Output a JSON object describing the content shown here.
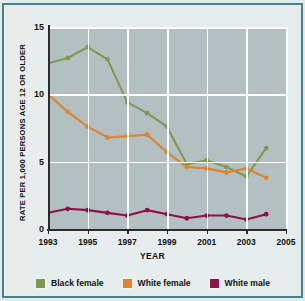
{
  "figure": {
    "background_color": "#e6edec",
    "frame_color": "#4b7f8a",
    "plot_background_color": "#b3bfc0",
    "gridline_color": "#ffffff",
    "title_partial": ""
  },
  "axes": {
    "ylabel": "RATE PER 1,000 PERSONS AGE 12 OR OLDER",
    "xlabel": "YEAR",
    "yticks": [
      "0",
      "5",
      "10",
      "15"
    ],
    "xticks": [
      "1993",
      "1995",
      "1997",
      "1999",
      "2001",
      "2003",
      "2005"
    ]
  },
  "legend": {
    "items": [
      {
        "label": "Black female",
        "color": "#7d9a55"
      },
      {
        "label": "White female",
        "color": "#e08331"
      },
      {
        "label": "White male",
        "color": "#8c1345"
      }
    ]
  },
  "chart_data": {
    "type": "line",
    "title": "",
    "xlabel": "YEAR",
    "ylabel": "RATE PER 1,000 PERSONS AGE 12 OR OLDER",
    "xlim": [
      1993,
      2005
    ],
    "ylim": [
      0,
      15
    ],
    "yticks": [
      0,
      5,
      10,
      15
    ],
    "xticks": [
      1993,
      1995,
      1997,
      1999,
      2001,
      2003,
      2005
    ],
    "grid": true,
    "legend_position": "bottom",
    "x": [
      1993,
      1994,
      1995,
      1996,
      1997,
      1998,
      1999,
      2000,
      2001,
      2002,
      2003,
      2004
    ],
    "series": [
      {
        "name": "Black female",
        "color": "#7d9a55",
        "values": [
          12.3,
          12.7,
          13.5,
          12.6,
          9.4,
          8.6,
          7.6,
          4.8,
          5.1,
          4.6,
          3.9,
          6.0
        ]
      },
      {
        "name": "White female",
        "color": "#e08331",
        "values": [
          10.0,
          8.7,
          7.6,
          6.8,
          6.9,
          7.0,
          5.7,
          4.6,
          4.5,
          4.2,
          4.5,
          3.8
        ]
      },
      {
        "name": "White male",
        "color": "#8c1345",
        "values": [
          1.2,
          1.5,
          1.4,
          1.2,
          1.0,
          1.4,
          1.1,
          0.8,
          1.0,
          1.0,
          0.7,
          1.1
        ]
      }
    ]
  }
}
